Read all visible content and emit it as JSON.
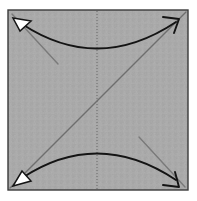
{
  "figure": {
    "type": "instructional-fold-diagram",
    "canvas": {
      "width": 197,
      "height": 201
    },
    "background_color": "#ffffff"
  },
  "paper": {
    "shape": "square",
    "x": 8,
    "y": 10,
    "width": 180,
    "height": 180,
    "fill_color": "#a9a9a9",
    "texture_color": "#9d9d9d",
    "border_color": "#3a3a3a",
    "border_width": 1.4
  },
  "creases": [
    {
      "name": "main-diagonal-crease",
      "style": "solid",
      "color": "#6e6e6e",
      "width": 1.4,
      "x1": 10,
      "y1": 188,
      "x2": 186,
      "y2": 12
    },
    {
      "name": "center-vertical-crease",
      "style": "dotted",
      "color": "#6e6e6e",
      "width": 1.1,
      "dash": "1,2",
      "x1": 97,
      "y1": 11,
      "x2": 97,
      "y2": 189
    },
    {
      "name": "top-left-corner-crease",
      "style": "solid",
      "color": "#7a7a7a",
      "width": 1.4,
      "x1": 12,
      "y1": 14,
      "x2": 58,
      "y2": 64
    },
    {
      "name": "bottom-right-corner-crease",
      "style": "solid",
      "color": "#7a7a7a",
      "width": 1.4,
      "x1": 139,
      "y1": 137,
      "x2": 185,
      "y2": 187
    }
  ],
  "arrows": [
    {
      "name": "top-fold-arrow",
      "description": "double-headed curved arrow bulging downward across the top",
      "color": "#141414",
      "width": 1.9,
      "path": "M 22 24 Q 98 74 176 22",
      "head_start": {
        "type": "filled-triangle",
        "fill": "#ffffff",
        "stroke": "#141414"
      },
      "head_end": {
        "type": "open-line",
        "stroke": "#141414"
      }
    },
    {
      "name": "bottom-fold-arrow",
      "description": "double-headed curved arrow bulging upward across the bottom",
      "color": "#141414",
      "width": 1.9,
      "path": "M 22 178 Q 98 128 176 180",
      "head_start": {
        "type": "filled-triangle",
        "fill": "#ffffff",
        "stroke": "#141414"
      },
      "head_end": {
        "type": "open-line",
        "stroke": "#141414"
      }
    }
  ],
  "labels": {
    "caption": ""
  }
}
